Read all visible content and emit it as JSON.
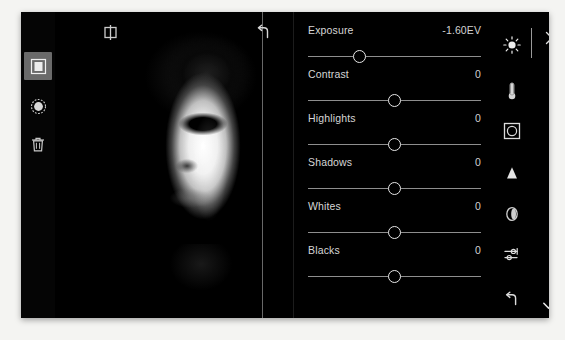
{
  "app": {
    "title": "photo-editor",
    "accent_selected": "#6a6a6a",
    "background": "#000000",
    "text_color": "#d6d6d6"
  },
  "left_rail": {
    "items": [
      {
        "name": "filter-tool",
        "icon": "square-filter-icon",
        "selected": true
      },
      {
        "name": "radial-gradient-tool",
        "icon": "radial-gradient-icon",
        "selected": false
      },
      {
        "name": "delete-tool",
        "icon": "trash-icon",
        "selected": false
      }
    ]
  },
  "canvas": {
    "compare_icon": "compare-split-icon",
    "undo_icon": "undo-arrow-icon",
    "split_divider": "before-after-divider",
    "image_description": "high-contrast black and white portrait of a child"
  },
  "panel": {
    "sliders": [
      {
        "label": "Exposure",
        "value": "-1.60EV",
        "position": 30
      },
      {
        "label": "Contrast",
        "value": "0",
        "position": 50
      },
      {
        "label": "Highlights",
        "value": "0",
        "position": 50
      },
      {
        "label": "Shadows",
        "value": "0",
        "position": 50
      },
      {
        "label": "Whites",
        "value": "0",
        "position": 50
      },
      {
        "label": "Blacks",
        "value": "0",
        "position": 50
      }
    ]
  },
  "right_rail": {
    "items": [
      {
        "name": "light-adjust",
        "icon": "sun-icon"
      },
      {
        "name": "color-adjust",
        "icon": "thermometer-icon"
      },
      {
        "name": "vignette",
        "icon": "vignette-frame-icon"
      },
      {
        "name": "geometry",
        "icon": "triangle-icon"
      },
      {
        "name": "lens-blur",
        "icon": "lens-icon"
      },
      {
        "name": "effects",
        "icon": "sliders-icon"
      },
      {
        "name": "reset",
        "icon": "undo-arrow-icon"
      }
    ],
    "close_icon": "close-x-icon",
    "confirm_icon": "checkmark-icon"
  }
}
